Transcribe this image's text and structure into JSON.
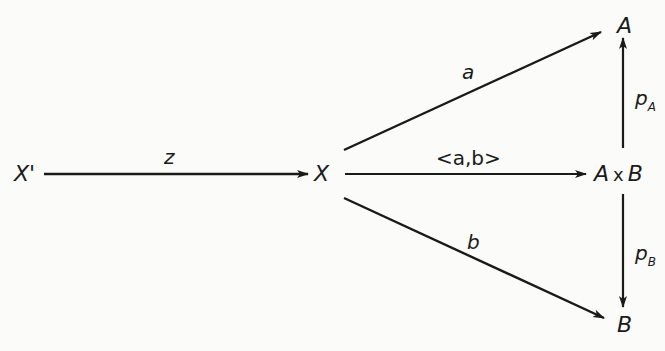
{
  "diagram": {
    "type": "commutative-diagram",
    "colors": {
      "ink": "#1a1a1a",
      "background": "#fbfbf9"
    },
    "nodes": {
      "x_prime": {
        "label": "X'"
      },
      "x": {
        "label": "X"
      },
      "a": {
        "label": "A"
      },
      "axb": {
        "label_left": "A",
        "times": "x",
        "label_right": "B"
      },
      "b": {
        "label": "B"
      }
    },
    "edges": {
      "z": {
        "from": "X'",
        "to": "X",
        "label": "z"
      },
      "a": {
        "from": "X",
        "to": "A",
        "label": "a"
      },
      "pair": {
        "from": "X",
        "to": "A x B",
        "label": "<a,b>"
      },
      "b": {
        "from": "X",
        "to": "B",
        "label": "b"
      },
      "p_a": {
        "from": "A x B",
        "to": "A",
        "label": "p",
        "subscript": "A"
      },
      "p_b": {
        "from": "A x B",
        "to": "B",
        "label": "p",
        "subscript": "B"
      }
    }
  }
}
